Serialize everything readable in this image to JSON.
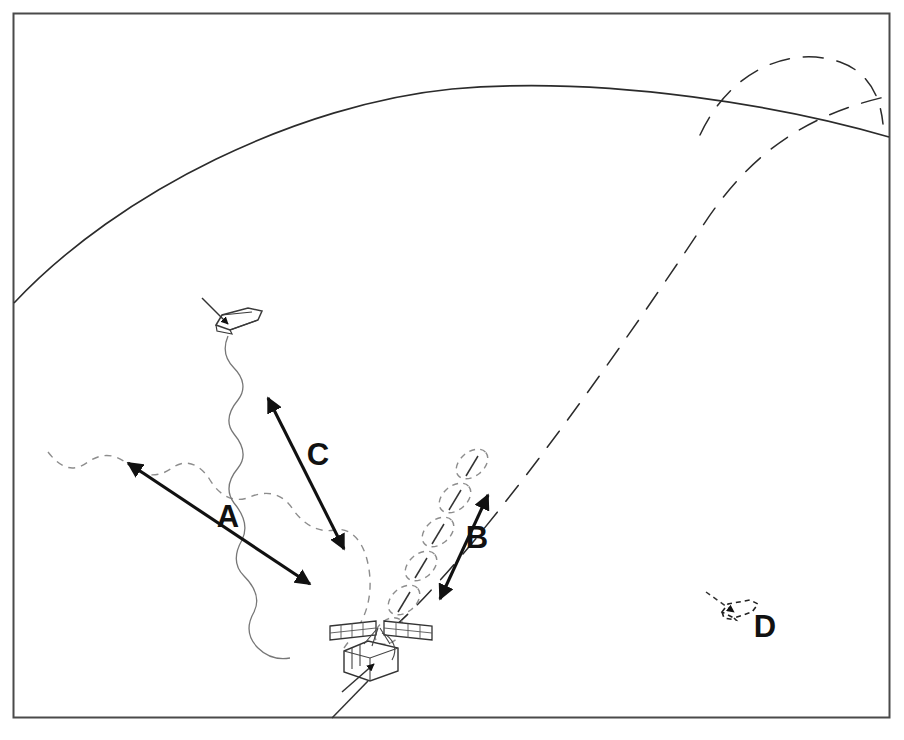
{
  "figure": {
    "background_color": "#ffffff",
    "ink_color": "#111111",
    "frame": {
      "name": "figure-border",
      "x": 13,
      "y": 13,
      "width": 877,
      "height": 705,
      "stroke_color": "#4a4a4a"
    }
  },
  "labels": [
    {
      "id": "A",
      "text": "A",
      "x": 228,
      "y": 527,
      "describes": "link-a-arrow"
    },
    {
      "id": "B",
      "text": "B",
      "x": 477,
      "y": 548,
      "describes": "link-b-arrow"
    },
    {
      "id": "C",
      "text": "C",
      "x": 318,
      "y": 465,
      "describes": "link-c-arrow"
    },
    {
      "id": "D",
      "text": "D",
      "x": 765,
      "y": 637,
      "describes": "ghost-aircraft"
    }
  ],
  "links": [
    {
      "id": "A",
      "label": "A",
      "style": "double-headed-arrow",
      "from": [
        128,
        463
      ],
      "to": [
        310,
        584
      ],
      "signal_path": "dashed-wave",
      "color": "#111111"
    },
    {
      "id": "B",
      "label": "B",
      "style": "double-headed-arrow",
      "from": [
        440,
        599
      ],
      "to": [
        488,
        495
      ],
      "signal_path": "dashed-helix",
      "color": "#111111"
    },
    {
      "id": "C",
      "label": "C",
      "style": "double-headed-arrow",
      "from": [
        268,
        398
      ],
      "to": [
        344,
        549
      ],
      "signal_path": "solid-wave",
      "color": "#111111"
    }
  ],
  "objects": {
    "horizon": {
      "name": "earth-horizon-curve",
      "style": "solid",
      "left_point": [
        14,
        303
      ],
      "apex": [
        452,
        88
      ],
      "right_point": [
        889,
        137
      ]
    },
    "orbit": {
      "name": "orbit-track",
      "style": "long-dashed",
      "from": [
        393,
        628
      ],
      "to": [
        889,
        96
      ],
      "apex_arc": [
        795,
        55
      ]
    },
    "satellite": {
      "name": "satellite",
      "center": [
        378,
        650
      ],
      "panel_count": 2,
      "has_solar_panels": true,
      "has_antenna_pointer": true
    },
    "aircraft": {
      "name": "aircraft",
      "center": [
        236,
        320
      ],
      "style": "solid-outline",
      "has_pointer": true
    },
    "ghost_aircraft": {
      "name": "ghost-aircraft",
      "center": [
        737,
        612
      ],
      "style": "dashed-outline",
      "label": "D",
      "has_pointer": true
    },
    "ground_pointer": {
      "name": "ground-station-pointer",
      "from": [
        332,
        718
      ],
      "to": [
        368,
        681
      ]
    }
  }
}
